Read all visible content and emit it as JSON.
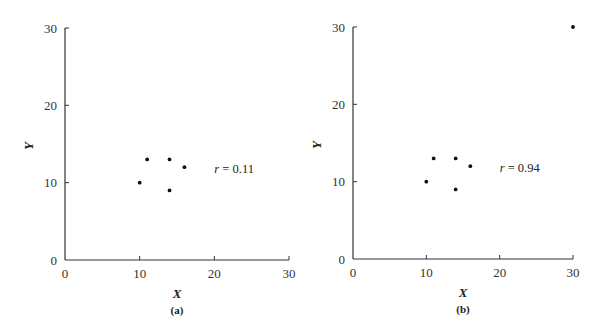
{
  "chart_data": [
    {
      "type": "scatter",
      "panel_label": "(a)",
      "title": "",
      "xlabel": "X",
      "ylabel": "Y",
      "xlim": [
        0,
        30
      ],
      "ylim": [
        0,
        30
      ],
      "x_ticks": [
        0,
        10,
        20,
        30
      ],
      "y_ticks": [
        0,
        10,
        20,
        30
      ],
      "grid": false,
      "legend": null,
      "points": [
        {
          "x": 10,
          "y": 10
        },
        {
          "x": 11,
          "y": 13
        },
        {
          "x": 14,
          "y": 13
        },
        {
          "x": 14,
          "y": 9
        },
        {
          "x": 16,
          "y": 12
        }
      ],
      "annotation": {
        "var": "r",
        "eq": " = 0.11",
        "x": 20,
        "y": 11
      }
    },
    {
      "type": "scatter",
      "panel_label": "(b)",
      "title": "",
      "xlabel": "X",
      "ylabel": "Y",
      "xlim": [
        0,
        30
      ],
      "ylim": [
        0,
        30
      ],
      "x_ticks": [
        0,
        10,
        20,
        30
      ],
      "y_ticks": [
        0,
        10,
        20,
        30
      ],
      "grid": false,
      "legend": null,
      "points": [
        {
          "x": 10,
          "y": 10
        },
        {
          "x": 11,
          "y": 13
        },
        {
          "x": 14,
          "y": 13
        },
        {
          "x": 14,
          "y": 9
        },
        {
          "x": 16,
          "y": 12
        },
        {
          "x": 30,
          "y": 30
        }
      ],
      "annotation": {
        "var": "r",
        "eq": " = 0.94",
        "x": 20,
        "y": 11
      }
    }
  ],
  "colors": {
    "axis": "#333333",
    "point": "#111111",
    "text": "#222222"
  }
}
